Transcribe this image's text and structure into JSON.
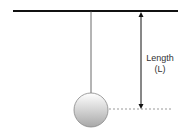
{
  "diagram": {
    "type": "pendulum",
    "label_line1": "Length",
    "label_line2": "(L)",
    "colors": {
      "bar": "#111111",
      "string": "#444444",
      "arrow": "#111111",
      "dash": "#999999",
      "ball_light": "#ffffff",
      "ball_dark": "#a8a8a8",
      "ball_stroke": "#888888"
    }
  }
}
